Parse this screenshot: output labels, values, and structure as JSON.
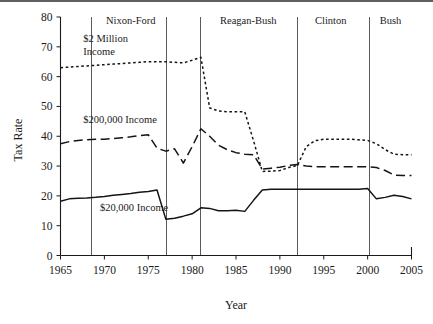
{
  "figure": {
    "background": "#ffffff",
    "line_color": "#141414",
    "divider_color": "#5a5a5a"
  },
  "chart_data": {
    "type": "line",
    "title": "",
    "xlabel": "Year",
    "ylabel": "Tax Rate",
    "xlim": [
      1965,
      2005
    ],
    "ylim": [
      0,
      80
    ],
    "xticks": [
      1965,
      1970,
      1975,
      1980,
      1985,
      1990,
      1995,
      2000,
      2005
    ],
    "xtick_labels": [
      "1965",
      "1970",
      "1975",
      "1980",
      "1985",
      "1990",
      "1995",
      "2000",
      "2005"
    ],
    "yticks": [
      0,
      10,
      20,
      30,
      40,
      50,
      60,
      70,
      80
    ],
    "ytick_labels": [
      "0",
      "10",
      "20",
      "30",
      "40",
      "50",
      "60",
      "70",
      "80"
    ],
    "grid": false,
    "legend": "inline-annotations",
    "annotations": [
      {
        "name": "2-million-income-label",
        "text": "$2 Million\nIncome",
        "line1": "$2 Million",
        "line2": "Income",
        "x": 1967.6,
        "y": 71.5
      },
      {
        "name": "200000-income-label",
        "text": "$200,000 Income",
        "x": 1967.6,
        "y": 44.5
      },
      {
        "name": "20000-income-label",
        "text": "$20,000 Income",
        "x": 1969.5,
        "y": 15.0
      }
    ],
    "era_dividers": [
      {
        "label": "Nixon-Ford",
        "x": 1968.5,
        "label_x": 1973.0
      },
      {
        "label": "",
        "x": 1977.0,
        "label_x": null
      },
      {
        "label": "Reagan-Bush",
        "x": 1980.9,
        "label_x": 1986.4
      },
      {
        "label": "Clinton",
        "x": 1992.0,
        "label_x": 1995.8
      },
      {
        "label": "Bush",
        "x": 2000.1,
        "label_x": 2002.6
      }
    ],
    "series": [
      {
        "name": "$2 Million Income",
        "style": "dotted",
        "x": [
          1965,
          1966,
          1967,
          1968,
          1969,
          1970,
          1971,
          1972,
          1973,
          1974,
          1975,
          1976,
          1977,
          1978,
          1979,
          1980,
          1981,
          1982,
          1983,
          1984,
          1985,
          1986,
          1987,
          1988,
          1989,
          1990,
          1991,
          1992,
          1993,
          1994,
          1995,
          1996,
          1997,
          1998,
          1999,
          2000,
          2001,
          2002,
          2003,
          2004,
          2005
        ],
        "values": [
          63.0,
          63.2,
          63.4,
          63.6,
          63.8,
          64.0,
          64.2,
          64.4,
          64.6,
          64.8,
          65.0,
          65.0,
          65.0,
          64.8,
          64.6,
          65.5,
          66.5,
          49.5,
          48.5,
          48.2,
          48.2,
          48.2,
          38.5,
          28.2,
          28.3,
          28.5,
          29.5,
          30.2,
          36.5,
          38.5,
          39.0,
          39.0,
          39.0,
          39.0,
          38.8,
          38.6,
          37.5,
          35.5,
          34.0,
          33.8,
          33.8
        ]
      },
      {
        "name": "$200,000 Income",
        "style": "dashed",
        "x": [
          1965,
          1966,
          1967,
          1968,
          1969,
          1970,
          1971,
          1972,
          1973,
          1974,
          1975,
          1976,
          1977,
          1978,
          1979,
          1980,
          1981,
          1982,
          1983,
          1984,
          1985,
          1986,
          1987,
          1988,
          1989,
          1990,
          1991,
          1992,
          1993,
          1994,
          1995,
          1996,
          1997,
          1998,
          1999,
          2000,
          2001,
          2002,
          2003,
          2004,
          2005
        ],
        "values": [
          37.5,
          38.2,
          38.6,
          38.8,
          39.0,
          39.0,
          39.2,
          39.5,
          39.8,
          40.2,
          40.5,
          36.0,
          35.0,
          35.8,
          31.0,
          36.5,
          42.5,
          40.0,
          37.0,
          35.5,
          34.5,
          34.0,
          33.8,
          29.0,
          29.3,
          29.6,
          30.2,
          30.5,
          30.0,
          29.8,
          29.8,
          29.8,
          29.8,
          29.8,
          29.8,
          29.8,
          29.5,
          28.5,
          27.0,
          26.8,
          26.8
        ]
      },
      {
        "name": "$20,000 Income",
        "style": "solid",
        "x": [
          1965,
          1966,
          1967,
          1968,
          1969,
          1970,
          1971,
          1972,
          1973,
          1974,
          1975,
          1976,
          1977,
          1978,
          1979,
          1980,
          1981,
          1982,
          1983,
          1984,
          1985,
          1986,
          1987,
          1988,
          1989,
          1990,
          1991,
          1992,
          1993,
          1994,
          1995,
          1996,
          1997,
          1998,
          1999,
          2000,
          2001,
          2002,
          2003,
          2004,
          2005
        ],
        "values": [
          18.2,
          19.0,
          19.2,
          19.3,
          19.5,
          19.8,
          20.2,
          20.5,
          20.8,
          21.2,
          21.5,
          22.0,
          12.2,
          12.5,
          13.2,
          14.0,
          16.0,
          15.8,
          15.0,
          15.0,
          15.2,
          14.8,
          18.5,
          22.0,
          22.2,
          22.2,
          22.2,
          22.2,
          22.2,
          22.2,
          22.2,
          22.2,
          22.2,
          22.2,
          22.2,
          22.5,
          19.0,
          19.5,
          20.2,
          19.8,
          19.0
        ]
      }
    ]
  }
}
